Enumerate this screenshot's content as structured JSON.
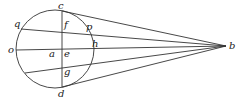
{
  "diagram": {
    "type": "geometry",
    "circle": {
      "cx": 55,
      "cy": 49,
      "r": 39
    },
    "apex": {
      "label": "b",
      "x": 226,
      "y": 46
    },
    "chords": [
      {
        "from": "c",
        "x1": 62,
        "y1": 11
      },
      {
        "from": "q",
        "x1": 21,
        "y1": 29
      },
      {
        "from": "o",
        "x1": 16,
        "y1": 50
      },
      {
        "from": "lower",
        "x1": 25,
        "y1": 73
      },
      {
        "from": "d",
        "x1": 62,
        "y1": 87
      }
    ],
    "vertical_line": {
      "x1": 62,
      "y1": 11,
      "x2": 62,
      "y2": 87
    },
    "labels": {
      "c": "c",
      "q": "q",
      "f": "f",
      "p": "p",
      "o": "o",
      "a": "a",
      "e": "e",
      "h": "h",
      "g": "g",
      "d": "d",
      "b": "b"
    }
  }
}
